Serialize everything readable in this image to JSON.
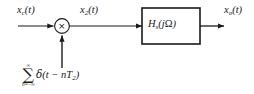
{
  "diagram": {
    "background_color": "#ffffff",
    "stroke_color": "#1a1a1a",
    "labels": {
      "input_signal": {
        "base": "x",
        "subscript": "c",
        "arg": "(t)",
        "full": "x_c(t)"
      },
      "intermediate_signal": {
        "base": "x",
        "subscript": "2",
        "arg": "(t)",
        "full": "x_2(t)"
      },
      "output_signal": {
        "base": "x",
        "subscript": "o",
        "arg": "(t)",
        "full": "x_o(t)"
      }
    },
    "multiplier": {
      "glyph": "×",
      "icon_name": "multiplier-circle",
      "center_x": 62,
      "center_y": 26,
      "radius": 7.5
    },
    "filter_block": {
      "base": "H",
      "subscript": "s",
      "arg_open": "(",
      "arg_j": "j",
      "arg_omega": "Ω",
      "arg_close": ")",
      "full": "H_s(jΩ)",
      "x": 142,
      "y": 8,
      "width": 58,
      "height": 36
    },
    "impulse_train": {
      "sigma": "∑",
      "upper_limit": "∞",
      "lower_limit": "n=−∞",
      "term_delta": "δ",
      "term_body_open": "(",
      "term_body": "t − nT",
      "term_subscript": "2",
      "term_body_close": ")",
      "full": "∑ (n=-∞..∞) δ(t − nT_2)"
    },
    "arrows": {
      "input_arrow": {
        "x1": 18,
        "y1": 26,
        "x2": 52,
        "y2": 26
      },
      "mid_arrow": {
        "x1": 70,
        "y1": 26,
        "x2": 141,
        "y2": 26
      },
      "output_arrow": {
        "x1": 200,
        "y1": 26,
        "x2": 223,
        "y2": 26
      },
      "sampler_arrow": {
        "x1": 62,
        "y1": 68,
        "x2": 62,
        "y2": 34
      }
    }
  }
}
